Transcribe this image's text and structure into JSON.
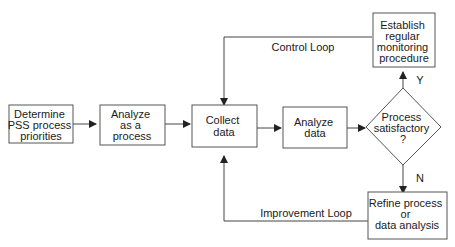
{
  "diagram": {
    "type": "flowchart",
    "nodes": {
      "determine": {
        "lines": [
          "Determine",
          "PSS process",
          "priorities"
        ]
      },
      "analyze_process": {
        "lines": [
          "Analyze",
          "as a",
          "process"
        ]
      },
      "collect": {
        "lines": [
          "Collect",
          "data"
        ]
      },
      "analyze_data": {
        "lines": [
          "Analyze",
          "data"
        ]
      },
      "decision": {
        "lines": [
          "Process",
          "satisfactory",
          "?"
        ]
      },
      "establish": {
        "lines": [
          "Establish",
          "regular",
          "monitoring",
          "procedure"
        ]
      },
      "refine": {
        "lines": [
          "Refine process",
          "or",
          "data analysis"
        ]
      }
    },
    "edge_labels": {
      "yes": "Y",
      "no": "N",
      "control_loop": "Control Loop",
      "improvement_loop": "Improvement Loop"
    },
    "colors": {
      "stroke": "#555555",
      "text": "#1a1a1a",
      "background": "#ffffff"
    }
  }
}
